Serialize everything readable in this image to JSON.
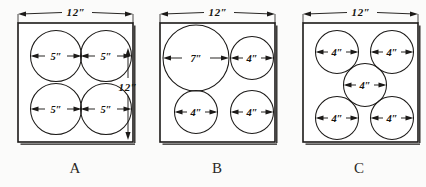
{
  "figure_set": {
    "caption_font_style": "serif",
    "ink_color": "#1c1a18",
    "paper_color": "#fbfbfa",
    "units": "inches",
    "figures": [
      {
        "id": "A",
        "label": "A",
        "square_top_dim": "12″",
        "square_side_dim": "12″",
        "has_side_dim": true,
        "circle_count": 4,
        "circles": [
          {
            "name": "top-left",
            "diameter_label": "5″",
            "cx": 56,
            "cy": 56,
            "r": 25.5
          },
          {
            "name": "top-right",
            "diameter_label": "5″",
            "cx": 106,
            "cy": 56,
            "r": 25.5
          },
          {
            "name": "bottom-left",
            "diameter_label": "5″",
            "cx": 56,
            "cy": 109,
            "r": 25.5
          },
          {
            "name": "bottom-right",
            "diameter_label": "5″",
            "cx": 106,
            "cy": 109,
            "r": 25.5
          }
        ],
        "square": {
          "x": 18,
          "y": 23,
          "w": 115,
          "h": 119
        }
      },
      {
        "id": "B",
        "label": "B",
        "square_top_dim": "12″",
        "has_side_dim": false,
        "circle_count": 4,
        "circles": [
          {
            "name": "top-left",
            "diameter_label": "7″",
            "cx": 196,
            "cy": 58,
            "r": 33
          },
          {
            "name": "top-right",
            "diameter_label": "4″",
            "cx": 252,
            "cy": 58,
            "r": 21.5
          },
          {
            "name": "bottom-left",
            "diameter_label": "4″",
            "cx": 196,
            "cy": 112,
            "r": 21.5
          },
          {
            "name": "bottom-right",
            "diameter_label": "4″",
            "cx": 252,
            "cy": 112,
            "r": 21.5
          }
        ],
        "square": {
          "x": 160,
          "y": 23,
          "w": 115,
          "h": 119
        }
      },
      {
        "id": "C",
        "label": "C",
        "square_top_dim": "12″",
        "has_side_dim": false,
        "circle_count": 5,
        "circles": [
          {
            "name": "top-left",
            "diameter_label": "4″",
            "cx": 337,
            "cy": 52,
            "r": 21.5
          },
          {
            "name": "top-right",
            "diameter_label": "4″",
            "cx": 392,
            "cy": 52,
            "r": 21.5
          },
          {
            "name": "center",
            "diameter_label": "4″",
            "cx": 365,
            "cy": 85,
            "r": 21.5
          },
          {
            "name": "bottom-left",
            "diameter_label": "4″",
            "cx": 337,
            "cy": 118,
            "r": 21.5
          },
          {
            "name": "bottom-right",
            "diameter_label": "4″",
            "cx": 392,
            "cy": 118,
            "r": 21.5
          }
        ],
        "square": {
          "x": 303,
          "y": 23,
          "w": 115,
          "h": 119
        }
      }
    ]
  }
}
